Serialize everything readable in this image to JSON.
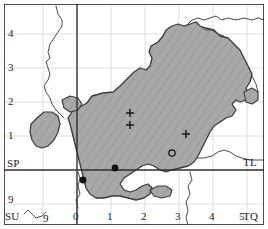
{
  "figure": {
    "type": "distribution-map",
    "region": "Ordnance Survey national grid extract",
    "width": 268,
    "height": 229
  },
  "colors": {
    "land_fill": "#a8a8a8",
    "hatch_line": "#9a9a9a",
    "coastline": "#3a3a3a",
    "county_line": "#555555",
    "major_grid": "#333333",
    "minor_grid": "#dddddd",
    "frame": "#222222",
    "marker": "#111111",
    "background": "#ffffff"
  },
  "axes": {
    "left_labels": [
      {
        "text": "4",
        "x": 8,
        "y": 34
      },
      {
        "text": "3",
        "x": 8,
        "y": 68
      },
      {
        "text": "2",
        "x": 8,
        "y": 102
      },
      {
        "text": "1",
        "x": 8,
        "y": 136
      },
      {
        "text": "SP",
        "x": 6,
        "y": 165
      },
      {
        "text": "9",
        "x": 8,
        "y": 201
      }
    ],
    "bottom_labels": [
      {
        "text": "SU",
        "x": 5,
        "y": 216
      },
      {
        "text": "9",
        "x": 43,
        "y": 218
      },
      {
        "text": "0",
        "x": 74,
        "y": 216
      },
      {
        "text": "1",
        "x": 108,
        "y": 216
      },
      {
        "text": "2",
        "x": 142,
        "y": 216
      },
      {
        "text": "3",
        "x": 176,
        "y": 216
      },
      {
        "text": "4",
        "x": 210,
        "y": 216
      },
      {
        "text": "5",
        "x": 241,
        "y": 216
      }
    ],
    "corner_labels": [
      {
        "text": "TL",
        "x": 245,
        "y": 163
      },
      {
        "text": "TQ",
        "x": 245,
        "y": 216
      }
    ],
    "major_grid_x": 77,
    "major_grid_y": 170,
    "minor_grid_spacing": 34
  },
  "markers": [
    {
      "symbol": "plus",
      "x": 130,
      "y": 113,
      "label": "record-plus-1"
    },
    {
      "symbol": "plus",
      "x": 130,
      "y": 125,
      "label": "record-plus-2"
    },
    {
      "symbol": "plus",
      "x": 186,
      "y": 134,
      "label": "record-plus-3"
    },
    {
      "symbol": "open-circle",
      "x": 172,
      "y": 153,
      "label": "record-open-1"
    },
    {
      "symbol": "filled-circle",
      "x": 115,
      "y": 168,
      "label": "record-filled-1"
    },
    {
      "symbol": "filled-circle",
      "x": 83,
      "y": 180,
      "label": "record-filled-2"
    }
  ],
  "legend_note": ""
}
